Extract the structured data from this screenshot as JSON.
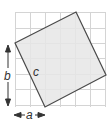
{
  "diagram": {
    "labels": {
      "a": "a",
      "b": "b",
      "c": "c"
    },
    "grid": {
      "x0": 15,
      "y0": 12,
      "cell": 15,
      "cols": 6,
      "rows": 6,
      "line_color": "#d4d4d4"
    },
    "square": {
      "points": "76,12 106,75 45,107 15,43",
      "fill": "#e6e6e6",
      "stroke": "#4a4a4a"
    },
    "colors": {
      "arrow": "#333333",
      "background": "#ffffff"
    }
  }
}
